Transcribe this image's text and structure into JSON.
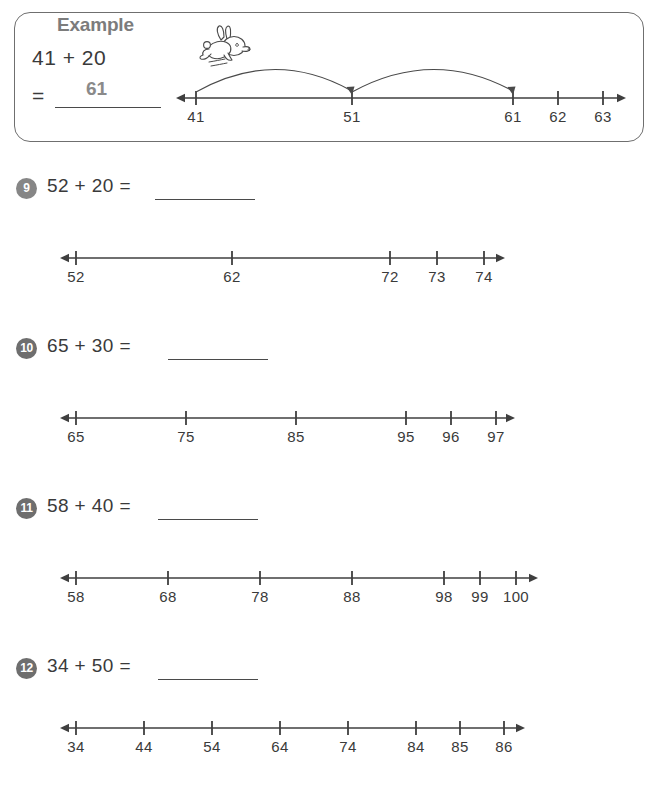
{
  "example": {
    "legend": "Example",
    "equation_line1": "41 + 20",
    "equation_line2": "=",
    "answer": "61",
    "numberline": {
      "labels": [
        "41",
        "51",
        "61",
        "62",
        "63"
      ],
      "start": 41,
      "hops": [
        {
          "from": "41",
          "to": "51"
        },
        {
          "from": "51",
          "to": "61"
        }
      ]
    },
    "illustration": "rabbit-hopping-icon"
  },
  "problems": [
    {
      "number": "9",
      "equation": "52 + 20 =",
      "answer_blank": "",
      "numberline": {
        "labels": [
          "52",
          "62",
          "72",
          "73",
          "74"
        ]
      }
    },
    {
      "number": "10",
      "equation": "65 + 30 =",
      "answer_blank": "",
      "numberline": {
        "labels": [
          "65",
          "75",
          "85",
          "95",
          "96",
          "97"
        ]
      }
    },
    {
      "number": "11",
      "equation": "58 + 40 =",
      "answer_blank": "",
      "numberline": {
        "labels": [
          "58",
          "68",
          "78",
          "88",
          "98",
          "99",
          "100"
        ]
      }
    },
    {
      "number": "12",
      "equation": "34 + 50 =",
      "answer_blank": "",
      "numberline": {
        "labels": [
          "34",
          "44",
          "54",
          "64",
          "74",
          "84",
          "85",
          "86"
        ]
      }
    }
  ],
  "colors": {
    "ink": "#3a3a3a",
    "badge": "#868686",
    "legend": "#7c7c7c",
    "answer": "#8a8a8a",
    "border": "#6f6f6f"
  }
}
